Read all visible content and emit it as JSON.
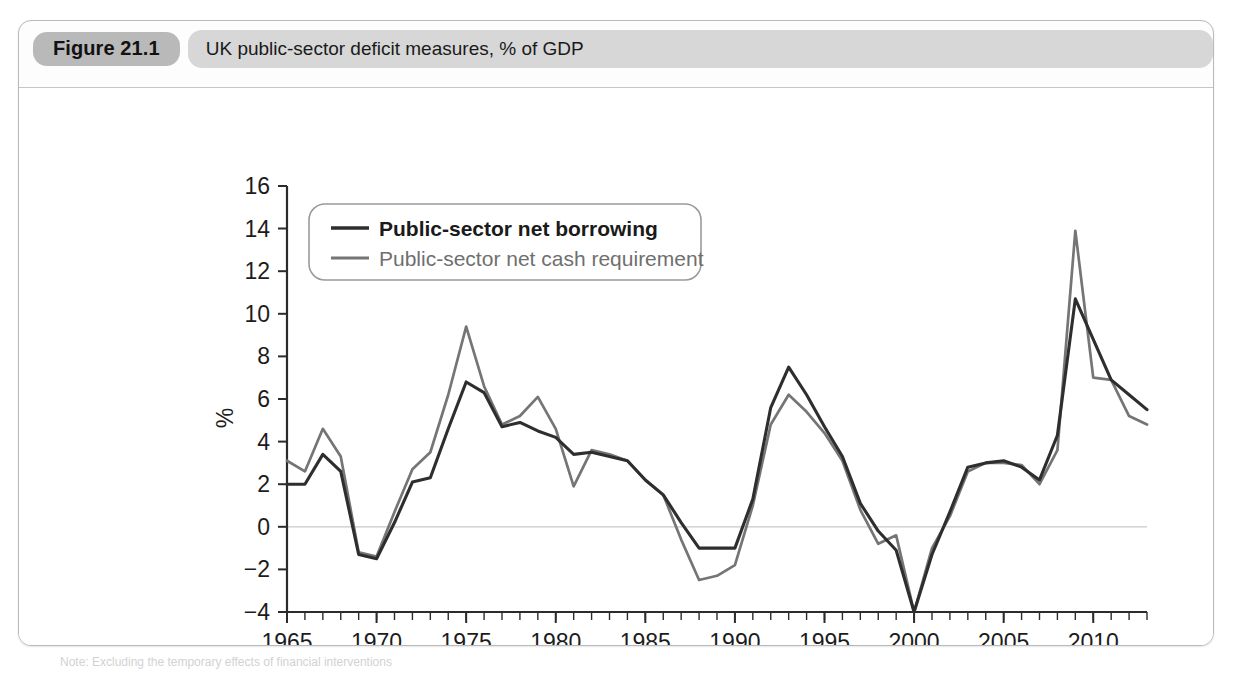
{
  "figure": {
    "number_label": "Figure 21.1",
    "title": "UK public-sector deficit measures, % of GDP",
    "note": "Note: Excluding the temporary effects of financial interventions"
  },
  "chart_data": {
    "type": "line",
    "title": "UK public-sector deficit measures, % of GDP",
    "xlabel": "",
    "ylabel": "%",
    "xlim": [
      1965,
      2013
    ],
    "ylim": [
      -4,
      16
    ],
    "ytick_step": 2,
    "xtick_step": 5,
    "xtick_minor_step": 1,
    "grid": false,
    "zero_line": true,
    "legend_position": "top-left",
    "y_ticks": [
      -4,
      -2,
      0,
      2,
      4,
      6,
      8,
      10,
      12,
      14,
      16
    ],
    "x_ticks": [
      1965,
      1970,
      1975,
      1980,
      1985,
      1990,
      1995,
      2000,
      2005,
      2010
    ],
    "x_tick_labels": [
      "1965",
      "1970",
      "1975",
      "1980",
      "1985",
      "1990",
      "1995",
      "2000",
      "2005",
      "2010"
    ],
    "y_tick_labels": [
      "-4",
      "-2",
      "0",
      "2",
      "4",
      "6",
      "8",
      "10",
      "12",
      "14",
      "16"
    ],
    "x": [
      1965,
      1966,
      1967,
      1968,
      1969,
      1970,
      1971,
      1972,
      1973,
      1974,
      1975,
      1976,
      1977,
      1978,
      1979,
      1980,
      1981,
      1982,
      1983,
      1984,
      1985,
      1986,
      1987,
      1988,
      1989,
      1990,
      1991,
      1992,
      1993,
      1994,
      1995,
      1996,
      1997,
      1998,
      1999,
      2000,
      2001,
      2002,
      2003,
      2004,
      2005,
      2006,
      2007,
      2008,
      2009,
      2010,
      2011,
      2012,
      2013
    ],
    "series": [
      {
        "name": "Public-sector net borrowing",
        "color": "#2e2e2e",
        "style": "solid",
        "width": 3.1,
        "values": [
          2.0,
          2.0,
          3.4,
          2.6,
          -1.3,
          -1.5,
          0.2,
          2.1,
          2.3,
          4.6,
          6.8,
          6.3,
          4.7,
          4.9,
          4.5,
          4.2,
          3.4,
          3.5,
          3.3,
          3.1,
          2.2,
          1.5,
          0.2,
          -1.0,
          -1.0,
          -1.0,
          1.3,
          5.6,
          7.5,
          6.2,
          4.7,
          3.3,
          1.1,
          -0.2,
          -1.1,
          -4.0,
          -1.3,
          0.7,
          2.8,
          3.0,
          3.1,
          2.8,
          2.2,
          4.3,
          10.7,
          8.8,
          6.9,
          6.2,
          5.5
        ]
      },
      {
        "name": "Public-sector net cash requirement",
        "color": "#757575",
        "style": "solid",
        "width": 2.7,
        "values": [
          3.1,
          2.6,
          4.6,
          3.3,
          -1.2,
          -1.4,
          0.7,
          2.7,
          3.5,
          6.2,
          9.4,
          6.6,
          4.8,
          5.2,
          6.1,
          4.6,
          1.9,
          3.6,
          3.4,
          3.1,
          2.2,
          1.5,
          -0.6,
          -2.5,
          -2.3,
          -1.8,
          1.0,
          4.8,
          6.2,
          5.4,
          4.4,
          3.1,
          0.8,
          -0.8,
          -0.4,
          -4.0,
          -1.0,
          0.5,
          2.6,
          3.0,
          3.0,
          2.9,
          2.0,
          3.6,
          13.9,
          7.0,
          6.9,
          5.2,
          4.8
        ]
      }
    ]
  }
}
